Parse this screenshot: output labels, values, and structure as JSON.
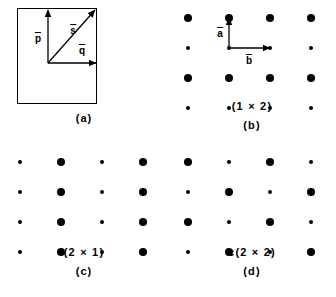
{
  "figure": {
    "background_color": "#ffffff",
    "ink_color": "#000000",
    "panel_count": 4
  },
  "chart_data": {
    "type": "scatter",
    "title": "",
    "xlabel": "",
    "ylabel": "",
    "grid": false,
    "legend": "none",
    "panels": [
      {
        "id": "a",
        "caption_notation": "",
        "caption_letter": "(a)",
        "kind": "unit-mesh-vectors",
        "rect": {
          "x": 17,
          "y": 8,
          "width": 80,
          "height": 96
        },
        "origin": {
          "x": 48,
          "y": 63
        },
        "vectors": [
          {
            "name": "p",
            "label": "p",
            "overbar": true,
            "from": [
              48,
              63
            ],
            "to": [
              48,
              10
            ],
            "label_pos": [
              38,
              38
            ],
            "direction": "up"
          },
          {
            "name": "s",
            "label": "s",
            "overbar": true,
            "from": [
              48,
              63
            ],
            "to": [
              95,
              10
            ],
            "label_pos": [
              73,
              30
            ],
            "direction": "diagonal-up-right"
          },
          {
            "name": "q",
            "label": "q",
            "overbar": true,
            "from": [
              48,
              63
            ],
            "to": [
              96,
              63
            ],
            "label_pos": [
              82,
              50
            ],
            "direction": "right"
          }
        ]
      },
      {
        "id": "b",
        "caption_notation": "(1 × 2)",
        "caption_letter": "(b)",
        "kind": "lattice",
        "columns": 4,
        "rows": 4,
        "col_x": [
          20,
          61,
          102,
          143
        ],
        "row_y": [
          18,
          48,
          78,
          108
        ],
        "dot_pattern": [
          [
            "large",
            "large",
            "large",
            "large"
          ],
          [
            "small",
            "small",
            "small",
            "small"
          ],
          [
            "large",
            "large",
            "large",
            "large"
          ],
          [
            "small",
            "small",
            "small",
            "small"
          ]
        ],
        "vectors": [
          {
            "name": "a",
            "label": "a",
            "overbar": true,
            "from": [
              61,
              48
            ],
            "to": [
              61,
              18
            ],
            "label_pos": [
              52,
              33
            ],
            "direction": "up"
          },
          {
            "name": "b",
            "label": "b",
            "overbar": true,
            "from": [
              61,
              48
            ],
            "to": [
              102,
              48
            ],
            "label_pos": [
              81,
              60
            ],
            "direction": "right"
          }
        ]
      },
      {
        "id": "c",
        "caption_notation": "(2 × 1)",
        "caption_letter": "(c)",
        "kind": "lattice",
        "columns": 4,
        "rows": 4,
        "col_x": [
          20,
          61,
          102,
          143
        ],
        "row_y": [
          13,
          43,
          73,
          103
        ],
        "dot_pattern": [
          [
            "small",
            "large",
            "small",
            "large"
          ],
          [
            "small",
            "large",
            "small",
            "large"
          ],
          [
            "small",
            "large",
            "small",
            "large"
          ],
          [
            "small",
            "large",
            "small",
            "large"
          ]
        ],
        "vectors": []
      },
      {
        "id": "d",
        "caption_notation": "c(2 × 2)",
        "caption_letter": "(d)",
        "kind": "lattice",
        "columns": 4,
        "rows": 4,
        "col_x": [
          20,
          61,
          102,
          143
        ],
        "row_y": [
          13,
          43,
          73,
          103
        ],
        "dot_pattern": [
          [
            "large",
            "small",
            "large",
            "small"
          ],
          [
            "small",
            "large",
            "small",
            "large"
          ],
          [
            "large",
            "small",
            "large",
            "small"
          ],
          [
            "small",
            "large",
            "small",
            "large"
          ]
        ],
        "vectors": []
      }
    ]
  }
}
